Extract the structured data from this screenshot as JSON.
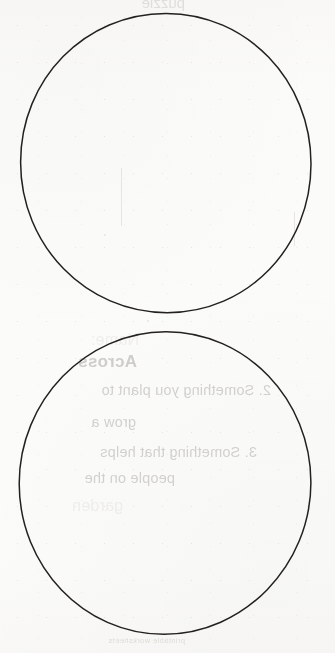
{
  "page": {
    "kind": "scanned-worksheet-page",
    "width": 335,
    "height": 653,
    "paper_color": "#fbfbfa",
    "ink_color": "#23211f",
    "bleed_color": "#b9b7b2"
  },
  "shapes": {
    "circles": [
      {
        "name": "upper-circle",
        "label": "Upper hand-drawn circle",
        "center_x": 166,
        "center_y": 163,
        "radius_x": 146,
        "radius_y": 151,
        "stroke_width": 1.5
      },
      {
        "name": "lower-circle",
        "label": "Lower hand-drawn circle",
        "center_x": 165,
        "center_y": 483,
        "radius_x": 145,
        "radius_y": 150,
        "stroke_width": 1.5
      }
    ]
  },
  "bleed_through": {
    "note": "Mirrored text showing through from the reverse side of the sheet",
    "top_fragment": "puzzle",
    "lines": [
      {
        "text": "Name:",
        "left": 196,
        "top": 331,
        "style": "faint"
      },
      {
        "text": "Across",
        "left": 198,
        "top": 352,
        "style": "heading"
      },
      {
        "text": "2. Something you plant to",
        "left": 64,
        "top": 382,
        "style": "body"
      },
      {
        "text": "grow a",
        "left": 199,
        "top": 414,
        "style": "body"
      },
      {
        "text": "3. Something that helps",
        "left": 78,
        "top": 444,
        "style": "body"
      },
      {
        "text": "people on the",
        "left": 160,
        "top": 470,
        "style": "body"
      },
      {
        "text": "garden",
        "left": 212,
        "top": 497,
        "style": "faint"
      }
    ],
    "footer": {
      "text": "printable worksheets",
      "left": 150,
      "top": 636
    }
  }
}
